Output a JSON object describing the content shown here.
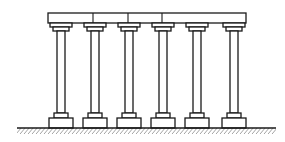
{
  "diagram": {
    "type": "colonnade",
    "colors": {
      "stroke": "#1a1a1a",
      "background": "#ffffff"
    },
    "beam": {
      "x1": 48,
      "x2": 246,
      "y1": 13,
      "y2": 23,
      "joints": [
        93,
        128,
        162
      ]
    },
    "columns": [
      {
        "cx": 61
      },
      {
        "cx": 95
      },
      {
        "cx": 129
      },
      {
        "cx": 163
      },
      {
        "cx": 197
      },
      {
        "cx": 234
      }
    ],
    "ground": {
      "x1": 17,
      "x2": 276,
      "y": 128
    }
  }
}
